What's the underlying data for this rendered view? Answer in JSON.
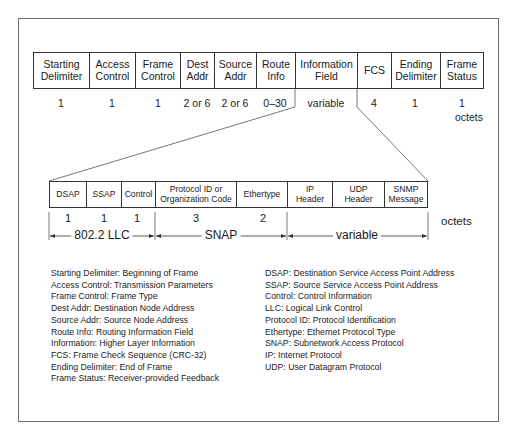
{
  "top_frame": {
    "fields": [
      {
        "label": "Starting Delimiter",
        "line1": "Starting",
        "line2": "Delimiter",
        "size": "1"
      },
      {
        "label": "Access Control",
        "line1": "Access",
        "line2": "Control",
        "size": "1"
      },
      {
        "label": "Frame Control",
        "line1": "Frame",
        "line2": "Control",
        "size": "1"
      },
      {
        "label": "Dest Addr",
        "line1": "Dest",
        "line2": "Addr",
        "size": "2 or 6"
      },
      {
        "label": "Source Addr",
        "line1": "Source",
        "line2": "Addr",
        "size": "2 or 6"
      },
      {
        "label": "Route Info",
        "line1": "Route",
        "line2": "Info",
        "size": "0–30"
      },
      {
        "label": "Information Field",
        "line1": "Information",
        "line2": "Field",
        "size": "variable"
      },
      {
        "label": "FCS",
        "line1": "FCS",
        "line2": "",
        "size": "4"
      },
      {
        "label": "Ending Delimiter",
        "line1": "Ending",
        "line2": "Delimiter",
        "size": "1"
      },
      {
        "label": "Frame Status",
        "line1": "Frame",
        "line2": "Status",
        "size": "1"
      }
    ],
    "unit": "octets"
  },
  "lower_frame": {
    "fields": [
      {
        "label": "DSAP",
        "line1": "DSAP",
        "line2": "",
        "size": "1"
      },
      {
        "label": "SSAP",
        "line1": "SSAP",
        "line2": "",
        "size": "1"
      },
      {
        "label": "Control",
        "line1": "Control",
        "line2": "",
        "size": "1"
      },
      {
        "label": "Protocol ID or Organization Code",
        "line1": "Protocol ID or",
        "line2": "Organization Code",
        "size": "3"
      },
      {
        "label": "Ethertype",
        "line1": "Ethertype",
        "line2": "",
        "size": "2"
      },
      {
        "label": "IP Header",
        "line1": "IP",
        "line2": "Header",
        "size": ""
      },
      {
        "label": "UDP Header",
        "line1": "UDP",
        "line2": "Header",
        "size": ""
      },
      {
        "label": "SNMP Message",
        "line1": "SNMP",
        "line2": "Message",
        "size": ""
      }
    ],
    "unit": "octets",
    "spans": [
      {
        "label": "802.2 LLC"
      },
      {
        "label": "SNAP"
      },
      {
        "label": "variable"
      }
    ]
  },
  "legend": {
    "left": [
      "Starting Delimiter:  Beginning of Frame",
      "Access Control:  Transmission Parameters",
      "Frame Control:  Frame Type",
      "Dest Addr:  Destination Node Address",
      "Source Addr:  Source Node Address",
      "Route Info:  Routing Information Field",
      "Information:  Higher Layer Information",
      "FCS:  Frame Check Sequence (CRC-32)",
      "Ending Delimiter:  End of Frame",
      "Frame Status:  Receiver-provided Feedback"
    ],
    "right": [
      "DSAP:  Destination Service Access Point Address",
      "SSAP:  Source Service Access Point Address",
      "Control:  Control Information",
      "LLC:  Logical Link Control",
      "Protocol ID:  Protocol Identification",
      "Ethertype:  Ethernet Protocol Type",
      "SNAP:  Subnetwork Access Protocol",
      "IP:  Internet Protocol",
      "UDP:  User Datagram Protocol"
    ]
  }
}
